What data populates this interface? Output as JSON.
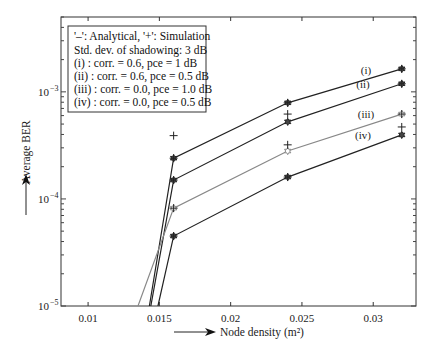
{
  "chart_data": {
    "type": "line",
    "title": "",
    "xlabel": "Node density (m²)",
    "ylabel": "Average BER",
    "xscale": "linear",
    "yscale": "log",
    "xlim": [
      0.0081,
      0.033
    ],
    "ylim": [
      1e-05,
      0.005
    ],
    "xticks": [
      0.01,
      0.015,
      0.02,
      0.025,
      0.03
    ],
    "xtick_labels": [
      "0.01",
      "0.015",
      "0.02",
      "0.025",
      "0.03"
    ],
    "yticks": [
      1e-05,
      0.0001,
      0.001
    ],
    "ytick_labels": [
      "10",
      "10",
      "10"
    ],
    "ytick_exponents": [
      "−5",
      "−4",
      "−3"
    ],
    "grid": false,
    "legend": {
      "position": "upper-left",
      "lines": [
        "'–': Analytical,    '+': Simulation",
        "Std. dev. of shadowing: 3 dB",
        "(i)     : corr. = 0.6, pce = 1 dB",
        "(ii)    : corr. = 0.6, pce = 0.5 dB",
        "(iii)   : corr. = 0.0, pce = 1.0 dB",
        "(iv)   : corr. = 0.0, pce = 0.5 dB"
      ]
    },
    "series": [
      {
        "name": "(i)",
        "label": "(i)",
        "color": "#222222",
        "x": [
          0.0143,
          0.016,
          0.024,
          0.032
        ],
        "values": [
          1e-05,
          0.00024,
          0.00079,
          0.00164
        ],
        "marker_x": [
          0.016,
          0.024,
          0.032
        ]
      },
      {
        "name": "(ii)",
        "label": "(ii)",
        "color": "#222222",
        "x": [
          0.0144,
          0.016,
          0.024,
          0.032
        ],
        "values": [
          1e-05,
          0.00015,
          0.000525,
          0.00119
        ],
        "marker_x": [
          0.016,
          0.024,
          0.032
        ]
      },
      {
        "name": "(iii)",
        "label": "(iii)",
        "color": "#888888",
        "x": [
          0.0135,
          0.016,
          0.024,
          0.032
        ],
        "values": [
          1e-05,
          8.2e-05,
          0.00028,
          0.00062
        ],
        "marker_x": [
          0.016,
          0.024,
          0.032
        ]
      },
      {
        "name": "(iv)",
        "label": "(iv)",
        "color": "#222222",
        "x": [
          0.0149,
          0.016,
          0.024,
          0.032
        ],
        "values": [
          1e-05,
          4.5e-05,
          0.00016,
          0.000396
        ],
        "marker_x": [
          0.016,
          0.024,
          0.032
        ]
      }
    ],
    "simulation_points": [
      {
        "x": 0.016,
        "y": 0.00039
      },
      {
        "x": 0.016,
        "y": 0.00024
      },
      {
        "x": 0.016,
        "y": 0.00015
      },
      {
        "x": 0.016,
        "y": 8.2e-05
      },
      {
        "x": 0.016,
        "y": 4.5e-05
      },
      {
        "x": 0.024,
        "y": 0.00079
      },
      {
        "x": 0.024,
        "y": 0.00062
      },
      {
        "x": 0.024,
        "y": 0.00032
      },
      {
        "x": 0.024,
        "y": 0.00016
      },
      {
        "x": 0.032,
        "y": 0.00164
      },
      {
        "x": 0.032,
        "y": 0.00119
      },
      {
        "x": 0.032,
        "y": 0.00062
      },
      {
        "x": 0.032,
        "y": 0.00047
      }
    ]
  }
}
